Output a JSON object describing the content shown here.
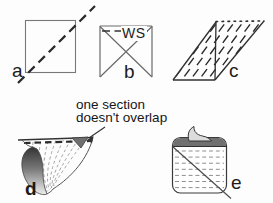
{
  "figure": {
    "background": "#fdfdfd",
    "ink": "#2a2a2a",
    "shade_dark": "#6f6f6f",
    "shade_light": "#dcdcdc",
    "panels": [
      {
        "id": "a",
        "label": "a",
        "description": "square with dashed diagonal fold line"
      },
      {
        "id": "b",
        "label": "b",
        "annotation": "WS",
        "description": "folded square, wrong side up, seam dashed under top edge"
      },
      {
        "id": "c",
        "label": "c",
        "description": "bias parallelogram with dashed grain lines and vertical seam"
      },
      {
        "id": "d",
        "label": "d",
        "callout": "one section\ndoesn't overlap",
        "description": "rolled tube with offset section"
      },
      {
        "id": "e",
        "label": "e",
        "description": "flattened tube with diagonal cut line"
      }
    ]
  }
}
